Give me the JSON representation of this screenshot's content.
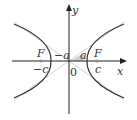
{
  "diagram": {
    "type": "hyperbola",
    "axes": {
      "x_label": "x",
      "y_label": "y",
      "origin_label": "0"
    },
    "labels": {
      "left_focus": "F",
      "right_focus": "F",
      "left_c": "−c",
      "right_c": "c",
      "left_a": "−a",
      "right_a": "a"
    },
    "colors": {
      "curve": "#333333",
      "asymptote": "#bbbbbb",
      "axis": "#222222",
      "shade": "#aaaaaa"
    }
  }
}
